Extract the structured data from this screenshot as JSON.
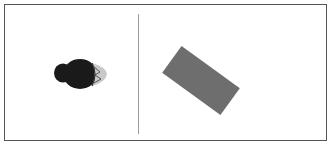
{
  "panels": {
    "left": {
      "figure": {
        "kind": "dark-rounded-figure",
        "fill": "#1a1a1a",
        "accent": "#bdbdbd"
      }
    },
    "right": {
      "shape": {
        "kind": "rotated-rectangle",
        "fill": "#6e6e6e",
        "rotation_deg": 36
      }
    }
  },
  "colors": {
    "frame": "#555555",
    "divider": "#9a9a9a",
    "background": "#ffffff"
  }
}
